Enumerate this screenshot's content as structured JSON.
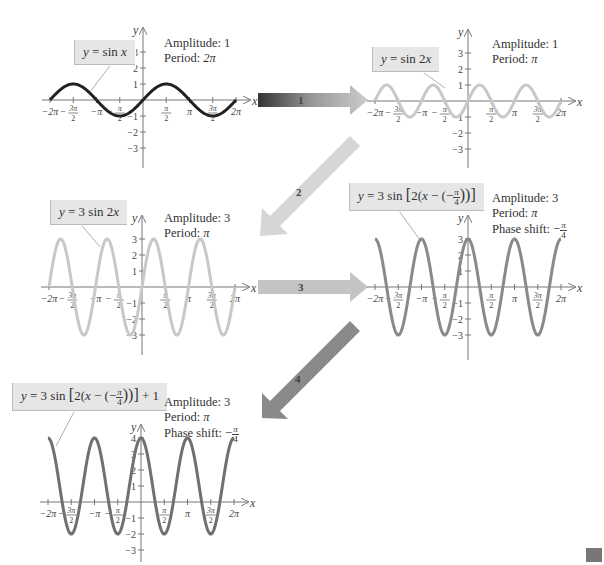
{
  "header_fragment": "(partially cropped equation text at top edge)",
  "transform_steps": [
    {
      "label": "1",
      "description": "horizontal shrink"
    },
    {
      "label": "2",
      "description": "vertical stretch"
    },
    {
      "label": "3",
      "description": "phase shift"
    },
    {
      "label": "4",
      "description": "vertical shift"
    }
  ],
  "graphs": [
    {
      "equation": "y = sin x",
      "info": [
        "Amplitude: 1",
        "Period: 2π"
      ],
      "curve_color": "#222222"
    },
    {
      "equation": "y = sin 2x",
      "info": [
        "Amplitude: 1",
        "Period: π"
      ],
      "curve_color": "#c8c8c8"
    },
    {
      "equation": "y = 3 sin 2x",
      "info": [
        "Amplitude: 3",
        "Period: π"
      ],
      "curve_color": "#c8c8c8"
    },
    {
      "equation": "y = 3 sin [2(x − (−π/4))]",
      "info": [
        "Amplitude: 3",
        "Period: π",
        "Phase shift: −π/4"
      ],
      "curve_color": "#8a8a8a"
    },
    {
      "equation": "y = 3 sin [2(x − (−π/4))] + 1",
      "info": [
        "Amplitude: 3",
        "Period: π",
        "Phase shift: −π/4"
      ],
      "curve_color": "#707070"
    }
  ],
  "axis": {
    "x_label": "x",
    "y_label": "y",
    "x_ticks": [
      "−2π",
      "−3π/2",
      "−π",
      "−π/2",
      "π/2",
      "π",
      "3π/2",
      "2π"
    ],
    "y_ticks": [
      "3",
      "2",
      "1",
      "−1",
      "−2",
      "−3"
    ],
    "y_ticks_shifted": [
      "4",
      "3",
      "2",
      "1",
      "−1",
      "−2",
      "−3"
    ]
  },
  "eq_parts": {
    "g1": {
      "lhs": "y",
      "eq": " = sin ",
      "var": "x"
    },
    "g2": {
      "lhs": "y",
      "eq": " = sin 2",
      "var": "x"
    },
    "g3": {
      "lhs": "y",
      "eq": " = 3 sin 2",
      "var": "x"
    },
    "g4": {
      "lhs": "y",
      "pre": " = 3 sin ",
      "open": "[",
      "two": "2(",
      "x": "x",
      "minus": " − (−",
      "pi": "π",
      "four": "4",
      "close": "))]"
    },
    "g5": {
      "lhs": "y",
      "pre": " = 3 sin ",
      "open": "[",
      "two": "2(",
      "x": "x",
      "minus": " − (−",
      "pi": "π",
      "four": "4",
      "close": "))]",
      "plus": " + 1"
    }
  },
  "info_labels": {
    "amp": "Amplitude:",
    "period": "Period:",
    "phase": "Phase shift:",
    "amp1": "1",
    "amp3": "3",
    "p2pi": "2π",
    "ppi": "π",
    "phase_neg": "−",
    "phase_num": "π",
    "phase_den": "4"
  }
}
